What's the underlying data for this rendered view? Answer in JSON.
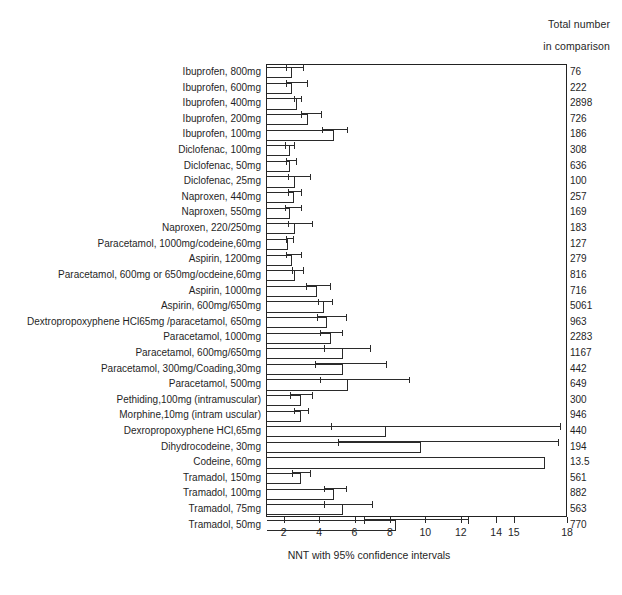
{
  "header": {
    "line1": "Total number",
    "line2": "in comparison"
  },
  "axis_title": "NNT with 95% confidence intervals",
  "chart_data": {
    "type": "bar",
    "orientation": "horizontal",
    "title": "",
    "subtitle": "",
    "xlabel": "NNT with 95% confidence intervals",
    "ylabel": "",
    "xlim": [
      1,
      18
    ],
    "xticks": [
      2,
      4,
      6,
      8,
      10,
      12,
      14,
      15,
      18
    ],
    "xticklabels": [
      "2",
      "4",
      "6",
      "8",
      "10",
      "12",
      "14",
      "15",
      "18"
    ],
    "grid": false,
    "legend": null,
    "bar_fill": "#ffffff",
    "bar_edge": "#2a2a2a",
    "error_bar_color": "#2b2b2b",
    "extra_column_header": [
      "Total number",
      "in comparison"
    ],
    "categories": [
      "Ibuprofen, 800mg",
      "Ibuprofen, 600mg",
      "Ibuprofen, 400mg",
      "Ibuprofen, 200mg",
      "Ibuprofen, 100mg",
      "Diclofenac, 100mg",
      "Diclofenac, 50mg",
      "Diclofenac, 25mg",
      "Naproxen, 440mg",
      "Naproxen, 550mg",
      "Naproxen, 220/250mg",
      "Paracetamol, 1000mg/codeine,60mg",
      "Aspirin, 1200mg",
      "Paracetamol, 600mg or 650mg/ocdeine,60mg",
      "Aspirin, 1000mg",
      "Aspirin, 600mg/650mg",
      "Dextropropoxyphene HCl65mg /paracetamol, 650mg",
      "Paracetamol, 1000mg",
      "Paracetamol, 600mg/650mg",
      "Paracetamol, 300mg/Coading,30mg",
      "Paracetamol, 500mg",
      "Pethiding,100mg (intramuscular)",
      "Morphine,10mg (intram uscular)",
      "Dexropropoxyphene HCl,65mg",
      "Dihydrocodeine, 30mg",
      "Codeine, 60mg",
      "Tramadol, 150mg",
      "Tramadol, 100mg",
      "Tramadol, 75mg",
      "Tramadol, 50mg"
    ],
    "values": [
      2.4,
      2.4,
      2.7,
      3.3,
      4.8,
      2.3,
      2.3,
      2.6,
      2.5,
      2.3,
      2.6,
      2.2,
      2.4,
      2.6,
      3.8,
      4.2,
      4.4,
      4.6,
      5.3,
      5.3,
      5.6,
      2.9,
      2.9,
      7.7,
      9.7,
      16.7,
      2.9,
      4.8,
      5.3,
      8.3
    ],
    "ci_low": [
      2.1,
      2.1,
      2.5,
      2.9,
      4.1,
      2.0,
      2.1,
      2.2,
      2.2,
      2.0,
      2.2,
      2.1,
      2.1,
      2.4,
      3.2,
      3.9,
      3.8,
      4.0,
      4.2,
      3.7,
      4.0,
      2.3,
      2.5,
      4.6,
      5.0,
      null,
      2.4,
      4.2,
      4.2,
      6.5
    ],
    "ci_high": [
      3.1,
      3.3,
      3.0,
      4.1,
      5.6,
      2.6,
      2.7,
      3.5,
      3.0,
      3.0,
      3.6,
      2.5,
      3.0,
      3.1,
      4.6,
      4.7,
      5.5,
      5.3,
      6.9,
      7.8,
      9.1,
      3.6,
      3.4,
      17.6,
      17.5,
      null,
      3.5,
      5.5,
      7.0,
      12.4
    ],
    "counts": [
      "76",
      "222",
      "2898",
      "726",
      "186",
      "308",
      "636",
      "100",
      "257",
      "169",
      "183",
      "127",
      "279",
      "816",
      "716",
      "5061",
      "963",
      "2283",
      "1167",
      "442",
      "649",
      "300",
      "946",
      "440",
      "194",
      "13.5",
      "561",
      "882",
      "563",
      "770"
    ]
  }
}
